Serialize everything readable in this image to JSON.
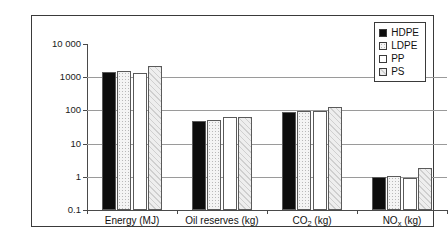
{
  "chart_data": {
    "type": "bar",
    "title": "",
    "subtitle": "",
    "xlabel": "",
    "ylabel": "",
    "yscale": "log",
    "ylim": [
      0.1,
      10000
    ],
    "grid": true,
    "legend_position": "top-right",
    "categories": [
      "Energy (MJ)",
      "Oil reserves (kg)",
      "CO2 (kg)",
      "NOx (kg)"
    ],
    "category_labels_html": [
      "Energy (MJ)",
      "Oil reserves (kg)",
      "CO<sub>2</sub> (kg)",
      "NO<sub>x</sub> (kg)"
    ],
    "ytick_labels": [
      "10 000",
      "1000",
      "100",
      "10",
      "1",
      "0.1"
    ],
    "ytick_values": [
      10000,
      1000,
      100,
      10,
      1,
      0.1
    ],
    "series": [
      {
        "name": "HDPE",
        "fill": "solid-black",
        "color": "#0d0d0d",
        "values": [
          1400,
          48,
          92,
          1.0
        ]
      },
      {
        "name": "LDPE",
        "fill": "dotted-light",
        "color": "#f4f4f4",
        "values": [
          1550,
          52,
          95,
          1.05
        ]
      },
      {
        "name": "PP",
        "fill": "white",
        "color": "#ffffff",
        "values": [
          1350,
          65,
          98,
          0.9
        ]
      },
      {
        "name": "PS",
        "fill": "diagonal-hatch",
        "color": "#eeeeee",
        "values": [
          2200,
          62,
          130,
          1.8
        ]
      }
    ]
  },
  "legend": {
    "items": [
      {
        "label": "HDPE",
        "swatch": "solid-black"
      },
      {
        "label": "LDPE",
        "swatch": "dotted-light"
      },
      {
        "label": "PP",
        "swatch": "white"
      },
      {
        "label": "PS",
        "swatch": "diagonal-hatch"
      }
    ]
  }
}
